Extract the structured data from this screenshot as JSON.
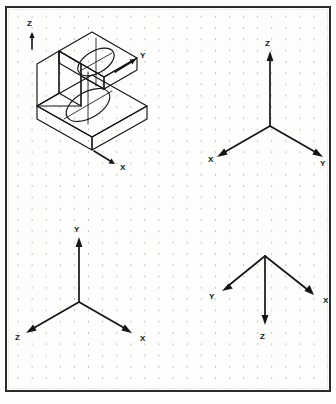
{
  "page": {
    "width": 336,
    "height": 404,
    "background_color": "#fdfdfb",
    "frame_color": "#2b2b2b",
    "ink_color": "#151515",
    "grid": {
      "style": "dotted",
      "dot_color": "#b9b8b4",
      "spacing_x": 14.1,
      "spacing_y": 11.3
    }
  },
  "panels": [
    {
      "id": "isometric-object",
      "name": "Isometric pictorial of C-shaped bracket",
      "position": "top-left",
      "description": "Stepped C-shaped block drawn in isometric with a through hole in the lower slab and a semicircular notch in the upper slab",
      "features": [
        "lower-slab",
        "upper-slab",
        "vertical-web",
        "through-hole",
        "semicircular-notch",
        "centerlines"
      ],
      "axes": [
        {
          "label": "Z",
          "direction": "up",
          "x": 31,
          "y": 24
        },
        {
          "label": "Y",
          "direction": "up-right",
          "x": 143,
          "y": 56
        },
        {
          "label": "X",
          "direction": "down-right",
          "x": 123,
          "y": 168
        }
      ]
    },
    {
      "id": "axis-triad-top-right",
      "name": "Axis triad 1",
      "position": "top-right",
      "origin": {
        "x": 270,
        "y": 126
      },
      "axes": [
        {
          "label": "Z",
          "direction": "up",
          "x": 268,
          "y": 44
        },
        {
          "label": "X",
          "direction": "down-left",
          "x": 211,
          "y": 159
        },
        {
          "label": "Y",
          "direction": "down-right",
          "x": 323,
          "y": 163
        }
      ]
    },
    {
      "id": "axis-triad-bottom-left",
      "name": "Axis triad 2",
      "position": "bottom-left",
      "origin": {
        "x": 79,
        "y": 302
      },
      "axes": [
        {
          "label": "Y",
          "direction": "up",
          "x": 77,
          "y": 230
        },
        {
          "label": "Z",
          "direction": "down-left",
          "x": 18,
          "y": 337
        },
        {
          "label": "X",
          "direction": "down-right",
          "x": 143,
          "y": 338
        }
      ]
    },
    {
      "id": "axis-triad-bottom-right",
      "name": "Axis triad 3",
      "position": "bottom-right",
      "origin": {
        "x": 265,
        "y": 256
      },
      "axes": [
        {
          "label": "Y",
          "direction": "up-left",
          "x": 212,
          "y": 297
        },
        {
          "label": "X",
          "direction": "up-right",
          "x": 326,
          "y": 301
        },
        {
          "label": "Z",
          "direction": "down",
          "x": 263,
          "y": 336
        }
      ]
    }
  ],
  "labels": {
    "iso_z": "Z",
    "iso_y": "Y",
    "iso_x": "X",
    "tr_z": "Z",
    "tr_x": "X",
    "tr_y": "Y",
    "bl_y": "Y",
    "bl_z": "Z",
    "bl_x": "X",
    "br_y": "Y",
    "br_x": "X",
    "br_z": "Z"
  }
}
